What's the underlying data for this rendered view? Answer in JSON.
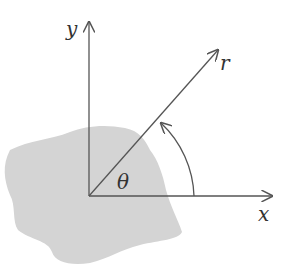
{
  "diagram": {
    "labels": {
      "y_axis": "y",
      "x_axis": "x",
      "radius": "r",
      "angle": "θ"
    },
    "colors": {
      "line": "#555555",
      "region_fill": "#d4d4d4",
      "text": "#333333",
      "background": "#ffffff"
    }
  }
}
